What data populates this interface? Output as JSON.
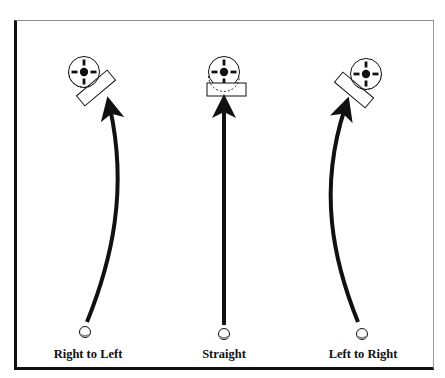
{
  "diagram": {
    "panels": [
      {
        "id": "right-to-left",
        "label": "Right to Left",
        "rect_rotation_deg": -40
      },
      {
        "id": "straight",
        "label": "Straight",
        "rect_rotation_deg": 0
      },
      {
        "id": "left-to-right",
        "label": "Left to Right",
        "rect_rotation_deg": 40
      }
    ],
    "colors": {
      "ink": "#111111",
      "background": "#ffffff",
      "frame_light": "#8a8a8a"
    }
  }
}
